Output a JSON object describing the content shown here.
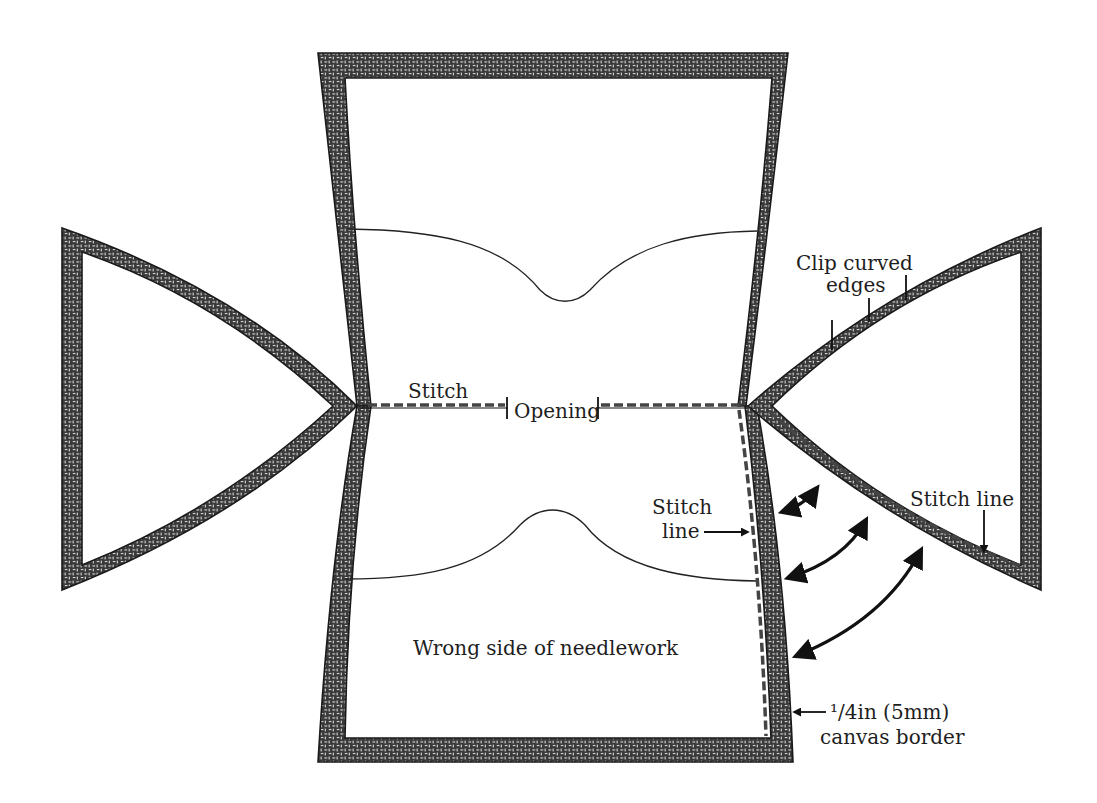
{
  "colors": {
    "background": "#ffffff",
    "canvas_dark": "#3a3a3a",
    "canvas_light": "#d8d8d8",
    "line": "#111111"
  },
  "labels": {
    "clip_curved_edges": [
      "Clip curved",
      "edges"
    ],
    "stitch": "Stitch",
    "opening": "Opening",
    "stitch_line_left": [
      "Stitch",
      "line"
    ],
    "stitch_line_right": "Stitch line",
    "wrong_side": "Wrong side of needlework",
    "canvas_border": [
      "¹/4in (5mm)",
      "canvas border"
    ]
  },
  "pieces": [
    {
      "id": "center-panel",
      "description": "Main panel with concave sides, two gusset curves"
    },
    {
      "id": "left-flap",
      "description": "Left curved triangular side flap"
    },
    {
      "id": "right-flap",
      "description": "Right curved triangular side flap"
    }
  ]
}
